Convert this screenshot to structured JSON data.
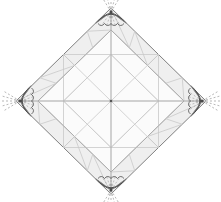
{
  "figure": {
    "type": "crease-pattern",
    "canvas": {
      "width": 221,
      "height": 202,
      "background": "#ffffff"
    },
    "colors": {
      "band_fill": "#efefef",
      "panel_fill": "#f7f7f7",
      "outline": "#808080",
      "crease_light": "#c9c9c9",
      "crease_mid": "#a8a8a8",
      "petal_stroke": "#4a4a4a",
      "dash_ray": "#9a9a9a",
      "center_dot": "#555555"
    },
    "diamond": {
      "name": "outer-square-rotated",
      "top": [
        111,
        8
      ],
      "right": [
        206,
        101
      ],
      "bottom": [
        111,
        194
      ],
      "left": [
        16,
        101
      ],
      "center": [
        111,
        101
      ]
    },
    "bands": {
      "label": "edge bands",
      "inset": 22,
      "count": 4
    },
    "petals": [
      {
        "name": "petal-top",
        "x": 111,
        "y": 12,
        "rotation": 0
      },
      {
        "name": "petal-right",
        "x": 202,
        "y": 101,
        "rotation": 90
      },
      {
        "name": "petal-bottom",
        "x": 111,
        "y": 190,
        "rotation": 180
      },
      {
        "name": "petal-left",
        "x": 20,
        "y": 101,
        "rotation": 270
      }
    ],
    "petal_detail": {
      "scallop_count": 4,
      "ray_count": 5,
      "ray_length": 18,
      "ray_dash": "2 2"
    },
    "axes": {
      "horizontal": {
        "from": [
          16,
          101
        ],
        "to": [
          206,
          101
        ],
        "arrows": "both"
      },
      "vertical": {
        "from": [
          111,
          8
        ],
        "to": [
          111,
          194
        ],
        "arrows": "both"
      }
    }
  }
}
